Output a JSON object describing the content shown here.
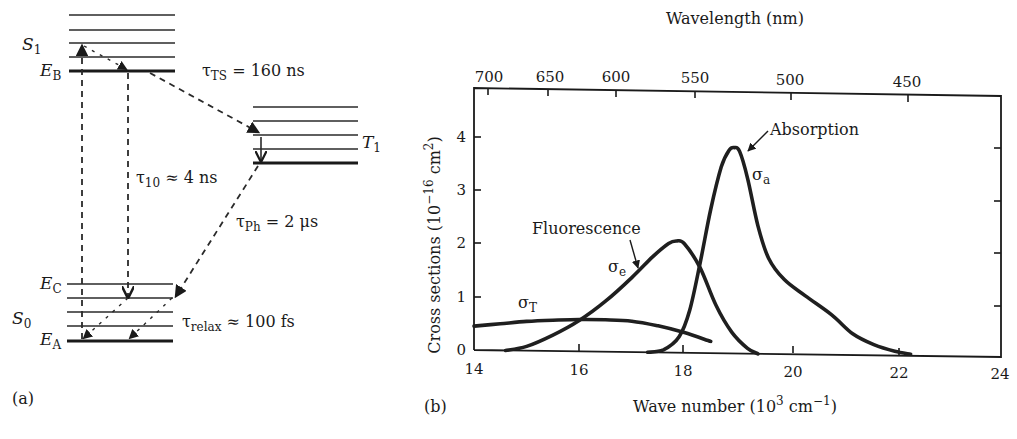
{
  "panel_a": {
    "label": "(a)",
    "states": {
      "S1": {
        "main": "S",
        "sub": "1"
      },
      "T1": {
        "main": "T",
        "sub": "1"
      },
      "S0": {
        "main": "S",
        "sub": "0"
      },
      "EB": {
        "main": "E",
        "sub": "B"
      },
      "EC": {
        "main": "E",
        "sub": "C"
      },
      "EA": {
        "main": "E",
        "sub": "A"
      }
    },
    "lifetimes": {
      "tau_TS": {
        "symbol": "τ",
        "sub": "TS",
        "rel": " = ",
        "value": "160 ns"
      },
      "tau_10": {
        "symbol": "τ",
        "sub": "10",
        "rel": " ≈ ",
        "value": "4 ns"
      },
      "tau_Ph": {
        "symbol": "τ",
        "sub": "Ph",
        "rel": " = ",
        "value": "2 μs"
      },
      "tau_relax": {
        "symbol": "τ",
        "sub": "relax",
        "rel": " ≈ ",
        "value": "100 fs"
      }
    }
  },
  "panel_b": {
    "label": "(b)",
    "top_axis_title": "Wavelength (nm)",
    "top_ticks": [
      "700",
      "650",
      "600",
      "550",
      "500",
      "450"
    ],
    "y_axis_title": {
      "prefix": "Cross sections (10",
      "exp": "−16",
      "mid": " cm",
      "exp2": "2",
      "suffix": ")"
    },
    "x_axis_title": {
      "prefix": "Wave number (10",
      "exp": "3",
      "mid": " cm",
      "exp2": "−1",
      "suffix": ")"
    },
    "x_ticks": [
      "14",
      "16",
      "18",
      "20",
      "22",
      "24"
    ],
    "y_ticks": [
      "0",
      "1",
      "2",
      "3",
      "4"
    ],
    "annotations": {
      "absorption": "Absorption",
      "fluorescence": "Fluorescence",
      "sigma_a": {
        "main": "σ",
        "sub": "a"
      },
      "sigma_e": {
        "main": "σ",
        "sub": "e"
      },
      "sigma_T": {
        "main": "σ",
        "sub": "T"
      }
    }
  },
  "chart_data": {
    "type": "line",
    "title": "",
    "xlabel": "Wave number (10^3 cm^-1)",
    "ylabel": "Cross sections (10^-16 cm^2)",
    "secondary_xlabel": "Wavelength (nm)",
    "secondary_x_ticks": [
      700,
      650,
      600,
      550,
      500,
      450
    ],
    "xlim": [
      14,
      24
    ],
    "ylim": [
      0,
      4.7
    ],
    "x_ticks": [
      14,
      16,
      18,
      20,
      22,
      24
    ],
    "y_ticks": [
      0,
      1,
      2,
      3,
      4
    ],
    "grid": false,
    "legend": "inline annotations",
    "series": [
      {
        "name": "Absorption (σa)",
        "x": [
          17.3,
          17.6,
          17.9,
          18.1,
          18.3,
          18.5,
          18.7,
          18.85,
          18.95,
          19.05,
          19.2,
          19.4,
          19.6,
          19.9,
          20.3,
          20.8,
          21.2,
          21.6,
          22.0,
          22.3
        ],
        "y": [
          0.0,
          0.05,
          0.3,
          0.8,
          1.7,
          2.7,
          3.5,
          3.82,
          3.87,
          3.8,
          3.3,
          2.4,
          1.8,
          1.4,
          1.1,
          0.75,
          0.4,
          0.2,
          0.08,
          0.03
        ]
      },
      {
        "name": "Fluorescence (σe)",
        "x": [
          14.6,
          15.0,
          15.5,
          16.0,
          16.5,
          17.0,
          17.4,
          17.7,
          17.85,
          18.0,
          18.3,
          18.6,
          18.9,
          19.2,
          19.4
        ],
        "y": [
          0.0,
          0.08,
          0.3,
          0.58,
          0.95,
          1.4,
          1.8,
          2.05,
          2.1,
          2.05,
          1.6,
          0.9,
          0.4,
          0.1,
          0.0
        ]
      },
      {
        "name": "Triplet absorption (σT)",
        "x": [
          14.0,
          14.5,
          15.0,
          15.5,
          16.0,
          16.5,
          17.0,
          17.5,
          18.0,
          18.5
        ],
        "y": [
          0.45,
          0.5,
          0.55,
          0.58,
          0.6,
          0.6,
          0.58,
          0.5,
          0.38,
          0.22
        ]
      }
    ],
    "annotations": [
      {
        "text": "Absorption",
        "points_to": "σa peak",
        "x": 19.1,
        "y": 3.85
      },
      {
        "text": "Fluorescence",
        "points_to": "σe",
        "x": 17.2,
        "y": 1.65
      },
      {
        "text": "σT",
        "x": 15.0,
        "y": 0.75
      }
    ]
  }
}
